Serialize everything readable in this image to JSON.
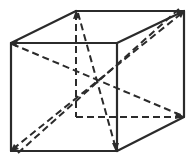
{
  "diagram": {
    "stroke_color": "#2b2b2b",
    "background": "#ffffff",
    "vertices": {
      "front_top_left": [
        11,
        43
      ],
      "front_top_right": [
        117,
        43
      ],
      "front_bottom_left": [
        11,
        151
      ],
      "front_bottom_right": [
        117,
        151
      ],
      "back_top_left": [
        76,
        11
      ],
      "back_top_right": [
        184,
        11
      ],
      "back_bottom_left": [
        76,
        117
      ],
      "back_bottom_right": [
        184,
        117
      ]
    },
    "solid_edges": [
      [
        "front_top_left",
        "front_top_right"
      ],
      [
        "front_top_right",
        "front_bottom_right"
      ],
      [
        "front_bottom_right",
        "front_bottom_left"
      ],
      [
        "front_bottom_left",
        "front_top_left"
      ],
      [
        "front_top_left",
        "back_top_left"
      ],
      [
        "back_top_left",
        "back_top_right"
      ],
      [
        "front_top_right",
        "back_top_right"
      ],
      [
        "back_top_right",
        "back_bottom_right"
      ],
      [
        "front_bottom_right",
        "back_bottom_right"
      ]
    ],
    "hidden_edges": [
      [
        "back_top_left",
        "back_bottom_left"
      ],
      [
        "back_bottom_left",
        "back_bottom_right"
      ],
      [
        "back_bottom_left",
        "front_bottom_left"
      ]
    ],
    "diagonals": [
      [
        "front_top_left",
        "back_bottom_right"
      ],
      [
        "back_top_left",
        "front_bottom_right"
      ],
      [
        "front_bottom_left",
        "back_top_right"
      ]
    ]
  }
}
